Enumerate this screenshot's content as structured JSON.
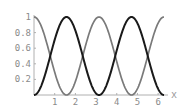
{
  "chart_data": {
    "type": "line",
    "title": "",
    "xlabel": "x",
    "ylabel": "",
    "xlim": [
      0,
      6.2832
    ],
    "ylim": [
      0,
      1
    ],
    "grid": false,
    "legend": null,
    "x_ticks": [
      "1",
      "2",
      "3",
      "4",
      "5",
      "6"
    ],
    "y_ticks": [
      "0.2",
      "0.4",
      "0.6",
      "0.8",
      "1"
    ],
    "series": [
      {
        "name": "cos^2(x)",
        "color": "#7a7a7a",
        "x": [
          0,
          0.785,
          1.571,
          2.356,
          3.142,
          3.927,
          4.712,
          5.498,
          6.283
        ],
        "values": [
          1,
          0.5,
          0,
          0.5,
          1,
          0.5,
          0,
          0.5,
          1
        ]
      },
      {
        "name": "sin^2(x)",
        "color": "#1a1a1a",
        "x": [
          0,
          0.785,
          1.571,
          2.356,
          3.142,
          3.927,
          4.712,
          5.498,
          6.283
        ],
        "values": [
          0,
          0.5,
          1,
          0.5,
          0,
          0.5,
          1,
          0.5,
          0
        ]
      }
    ]
  }
}
